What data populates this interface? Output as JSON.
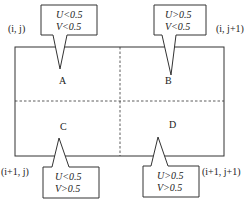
{
  "corners": {
    "top_left": "(i, j)",
    "top_right": "(i, j+1)",
    "bottom_left": "(i+1, j)",
    "bottom_right": "(i+1, j+1)"
  },
  "cells": [
    {
      "id": "A",
      "label": "A",
      "cond_u": "U<0.5",
      "cond_v": "V<0.5"
    },
    {
      "id": "B",
      "label": "B",
      "cond_u": "U>0.5",
      "cond_v": "V<0.5"
    },
    {
      "id": "C",
      "label": "C",
      "cond_u": "U<0.5",
      "cond_v": "V>0.5"
    },
    {
      "id": "D",
      "label": "D",
      "cond_u": "U>0.5",
      "cond_v": "V>0.5"
    }
  ],
  "colors": {
    "stroke": "#333333",
    "text": "#222222"
  }
}
